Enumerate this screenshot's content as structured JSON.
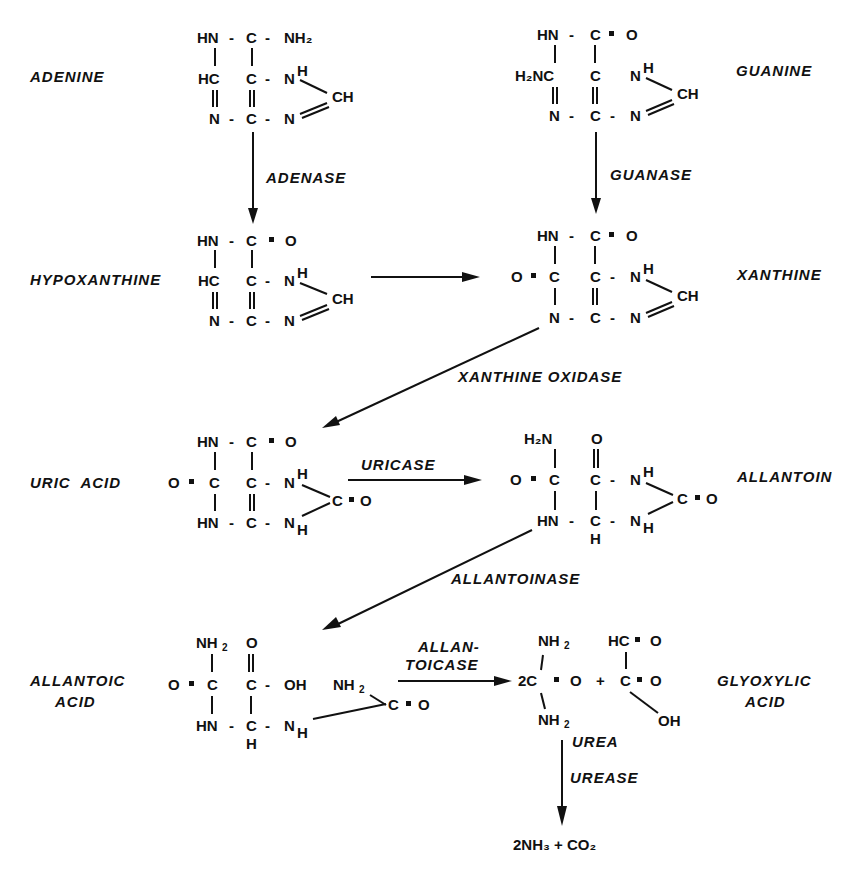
{
  "diagram": {
    "compounds": {
      "adenine": "ADENINE",
      "guanine": "GUANINE",
      "hypoxanthine": "HYPOXANTHINE",
      "xanthine": "XANTHINE",
      "uric_acid": "URIC  ACID",
      "allantoin": "ALLANTOIN",
      "allantoic_acid_1": "ALLANTOIC",
      "allantoic_acid_2": "ACID",
      "glyoxylic_acid_1": "GLYOXYLIC",
      "glyoxylic_acid_2": "ACID",
      "urea": "UREA",
      "products": "2NH₃ + CO₂"
    },
    "enzymes": {
      "adenase": "ADENASE",
      "guanase": "GUANASE",
      "xanthine_oxidase": "XANTHINE  OXIDASE",
      "uricase": "URICASE",
      "allantoinase": "ALLANTOINASE",
      "allantoicase_1": "ALLAN-",
      "allantoicase_2": "TOICASE",
      "urease": "UREASE"
    },
    "atoms": {
      "HN": "HN",
      "N": "N",
      "C": "C",
      "HC": "HC",
      "CH": "CH",
      "H": "H",
      "O": "O",
      "OH": "OH",
      "NH": "NH",
      "H2": "2",
      "eq": "=",
      "dash": "-",
      "plus": "+",
      "twoC": "2C",
      "H2N_guan": "H₂NC",
      "NH2": "NH₂",
      "H2N": "H₂N",
      "HC_eq": "HC",
      "C_eq": "C"
    }
  }
}
